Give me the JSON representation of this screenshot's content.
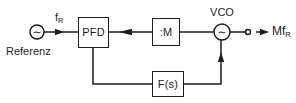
{
  "diagram": {
    "source": {
      "label": "Referenz",
      "symbol": "∼"
    },
    "signals": {
      "input_main": "f",
      "input_sub": "R",
      "output_main": "Mf",
      "output_sub": "R"
    },
    "blocks": {
      "pfd": "PFD",
      "divider": ":M",
      "filter": "F(s)",
      "vco_label": "VCO",
      "vco_symbol": "∼"
    },
    "icons": {
      "source_symbol": "sine-icon",
      "vco_symbol": "sine-icon",
      "output_terminal": "open-circle-terminal"
    },
    "colors": {
      "line": "#1c1c1c",
      "background": "#ffffff"
    }
  }
}
